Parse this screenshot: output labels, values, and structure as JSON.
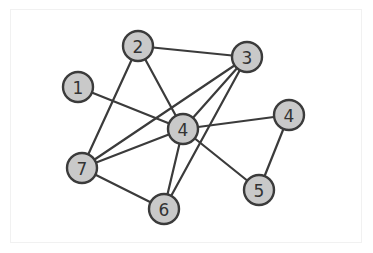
{
  "diagram": {
    "type": "undirected-graph",
    "colors": {
      "background": "#ffffff",
      "node_fill": "#c9c9c9",
      "stroke": "#3b3b3b",
      "label": "#333333"
    },
    "nodes": [
      {
        "id": "n1",
        "label": "1",
        "x": 78,
        "y": 87
      },
      {
        "id": "n2",
        "label": "2",
        "x": 138,
        "y": 46
      },
      {
        "id": "n3",
        "label": "3",
        "x": 247,
        "y": 57
      },
      {
        "id": "n4r",
        "label": "4",
        "x": 289,
        "y": 115
      },
      {
        "id": "n4c",
        "label": "4",
        "x": 183,
        "y": 129
      },
      {
        "id": "n5",
        "label": "5",
        "x": 259,
        "y": 190
      },
      {
        "id": "n6",
        "label": "6",
        "x": 164,
        "y": 209
      },
      {
        "id": "n7",
        "label": "7",
        "x": 82,
        "y": 168
      }
    ],
    "edges": [
      [
        "n2",
        "n3"
      ],
      [
        "n2",
        "n7"
      ],
      [
        "n2",
        "n4c"
      ],
      [
        "n1",
        "n4c"
      ],
      [
        "n3",
        "n7"
      ],
      [
        "n3",
        "n4c"
      ],
      [
        "n3",
        "n6"
      ],
      [
        "n4c",
        "n4r"
      ],
      [
        "n4c",
        "n5"
      ],
      [
        "n4c",
        "n6"
      ],
      [
        "n4c",
        "n7"
      ],
      [
        "n7",
        "n6"
      ],
      [
        "n4r",
        "n5"
      ]
    ]
  }
}
